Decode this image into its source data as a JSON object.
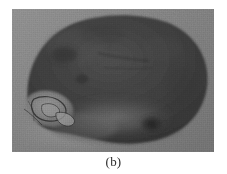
{
  "figure": {
    "caption": "(b)",
    "panel_label": "b",
    "image_type": "grayscale photograph",
    "photo": {
      "left": 12,
      "top": 9,
      "width": 202,
      "height": 143,
      "background_color": "#7b7b7b",
      "page_background_color": "#ffffff"
    },
    "colors": {
      "page_background": "#ffffff",
      "photo_background": "#7b7b7b",
      "photo_background_light": "#8e8e8e",
      "photo_background_dark": "#6a6a6a",
      "tuber_body": "#3c3c3c",
      "tuber_body_dark": "#2e2e2e",
      "tuber_body_light": "#4e4e4e",
      "tuber_lower_light": "#686868",
      "lesion_light": "#9a9a9a",
      "lesion_mid": "#7d7d7d",
      "lesion_outline": "#262626",
      "eye_spot": "#2a2a2a",
      "crack_line": "#252525",
      "caption_text": "#2b2b2b"
    },
    "features": [
      {
        "name": "tuber-outline",
        "description": "large dark oval tuber occupying most of the frame",
        "center_x": 112,
        "center_y": 72
      },
      {
        "name": "lesion-cavity",
        "description": "light irregular wound or cavity on the lower-left of the tuber",
        "center_x": 40,
        "center_y": 102
      },
      {
        "name": "eye-spot",
        "description": "small dark bud eye on the lower-right of the tuber",
        "center_x": 140,
        "center_y": 116
      },
      {
        "name": "surface-crack",
        "description": "faint horizontal crack across the upper-middle of the tuber",
        "center_x": 108,
        "center_y": 52
      },
      {
        "name": "shadow-band",
        "description": "lighter background shadow band under the lower-left of the tuber",
        "center_x": 60,
        "center_y": 128
      }
    ]
  }
}
